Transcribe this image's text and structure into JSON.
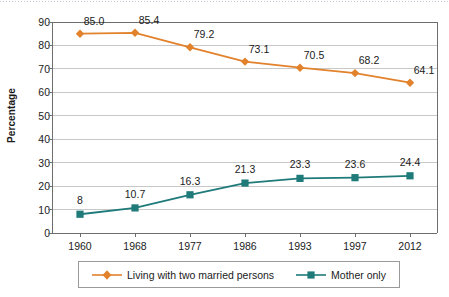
{
  "chart_data": {
    "type": "line",
    "title": "",
    "xlabel": "",
    "ylabel": "Percentage",
    "categories": [
      "1960",
      "1968",
      "1977",
      "1986",
      "1993",
      "1997",
      "2012"
    ],
    "ylim": [
      0,
      90
    ],
    "yticks": [
      "0",
      "10",
      "20",
      "30",
      "40",
      "50",
      "60",
      "70",
      "80",
      "90"
    ],
    "grid": "horizontal",
    "legend_position": "bottom",
    "series": [
      {
        "name": "Living with two married persons",
        "color": "#E2822C",
        "marker": "diamond",
        "values": [
          85.0,
          85.4,
          79.2,
          73.1,
          70.5,
          68.2,
          64.1
        ],
        "labels": [
          "85.0",
          "85.4",
          "79.2",
          "73.1",
          "70.5",
          "68.2",
          "64.1"
        ]
      },
      {
        "name": "Mother only",
        "color": "#1F7A7A",
        "marker": "square",
        "values": [
          8,
          10.7,
          16.3,
          21.3,
          23.3,
          23.6,
          24.4
        ],
        "labels": [
          "8",
          "10.7",
          "16.3",
          "21.3",
          "23.3",
          "23.6",
          "24.4"
        ]
      }
    ]
  },
  "legend": {
    "items": [
      {
        "label": "Living with two married persons"
      },
      {
        "label": "Mother only"
      }
    ]
  },
  "colors": {
    "series_orange": "#E2822C",
    "series_teal": "#1F7A7A",
    "gridline": "#C8C8C8",
    "axis": "#6E6E6E",
    "text": "#1B1B1B"
  }
}
